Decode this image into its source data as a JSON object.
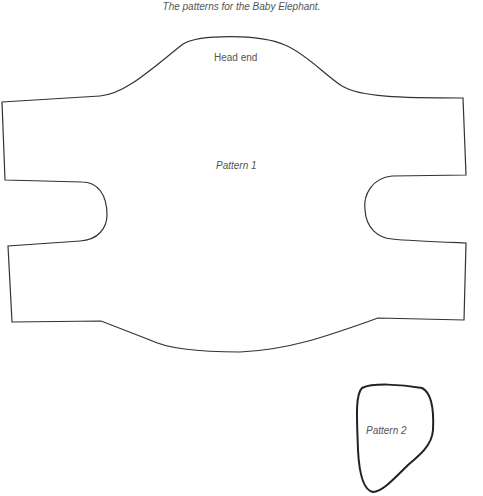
{
  "caption": "The patterns for the Baby Elephant.",
  "pattern1": {
    "label": "Pattern 1",
    "head_label": "Head end"
  },
  "pattern2": {
    "label": "Pattern 2"
  },
  "colors": {
    "outline": "#333333",
    "text": "#555555",
    "background": "#ffffff"
  }
}
